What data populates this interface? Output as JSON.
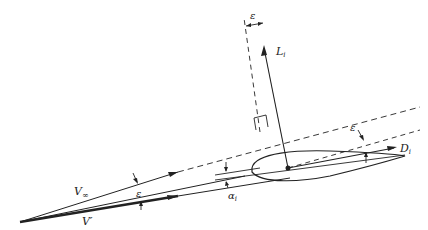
{
  "diagram": {
    "labels": {
      "lift": "L",
      "lift_sub": "i",
      "drag": "D",
      "drag_sub": "i",
      "freestream": "V",
      "freestream_sub": "∞",
      "local_velocity": "V′",
      "epsilon_top": "ε",
      "epsilon_right": "ε",
      "epsilon_left": "ε",
      "alpha": "α",
      "alpha_sub": "i"
    },
    "colors": {
      "ink": "#222222",
      "background": "#ffffff"
    }
  }
}
